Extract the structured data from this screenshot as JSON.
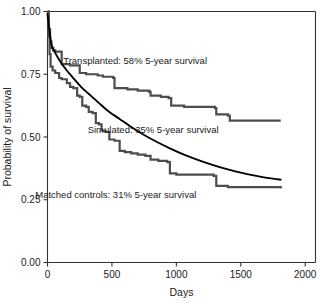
{
  "chart_data": {
    "type": "line",
    "title": "",
    "xlabel": "Days",
    "ylabel": "Probability of survival",
    "xlim": [
      0,
      2080
    ],
    "ylim": [
      0,
      1
    ],
    "xticks": [
      0,
      500,
      1000,
      1500,
      2000
    ],
    "xtick_labels": [
      "0",
      "500",
      "1000",
      "1500",
      "2000"
    ],
    "yticks": [
      0,
      0.25,
      0.5,
      0.75,
      1
    ],
    "ytick_labels": [
      "0.00",
      "0.25",
      "0.50",
      "0.75",
      "1.00"
    ],
    "grid": false,
    "legend_position": "inline-annotations",
    "series": [
      {
        "name": "Transplanted",
        "style": "step",
        "color": "#4d4d4d",
        "five_year_survival_pct": 58,
        "x": [
          0,
          10,
          20,
          30,
          45,
          60,
          110,
          175,
          250,
          250,
          300,
          390,
          430,
          510,
          520,
          620,
          700,
          790,
          800,
          880,
          940,
          960,
          1060,
          1300,
          1310,
          1400,
          1415,
          1810
        ],
        "y": [
          1.0,
          0.93,
          0.88,
          0.855,
          0.845,
          0.84,
          0.79,
          0.785,
          0.78,
          0.755,
          0.75,
          0.745,
          0.74,
          0.735,
          0.695,
          0.69,
          0.685,
          0.68,
          0.665,
          0.66,
          0.655,
          0.625,
          0.62,
          0.615,
          0.59,
          0.585,
          0.565,
          0.565
        ]
      },
      {
        "name": "Matched controls",
        "style": "step",
        "color": "#4d4d4d",
        "five_year_survival_pct": 31,
        "x": [
          0,
          8,
          16,
          24,
          40,
          60,
          90,
          110,
          150,
          175,
          200,
          230,
          250,
          270,
          300,
          320,
          350,
          375,
          400,
          420,
          450,
          480,
          520,
          560,
          600,
          650,
          700,
          760,
          800,
          860,
          930,
          950,
          1000,
          1290,
          1310,
          1400,
          1810
        ],
        "y": [
          1.0,
          0.9,
          0.83,
          0.78,
          0.765,
          0.755,
          0.735,
          0.73,
          0.715,
          0.7,
          0.695,
          0.665,
          0.66,
          0.625,
          0.62,
          0.6,
          0.595,
          0.555,
          0.55,
          0.525,
          0.52,
          0.49,
          0.485,
          0.445,
          0.44,
          0.435,
          0.43,
          0.425,
          0.41,
          0.405,
          0.4,
          0.355,
          0.35,
          0.345,
          0.305,
          0.3,
          0.295
        ]
      },
      {
        "name": "Simulated",
        "style": "smooth",
        "color": "#000000",
        "five_year_survival_pct": 35,
        "x": [
          0,
          30,
          60,
          100,
          150,
          200,
          260,
          320,
          400,
          480,
          560,
          650,
          750,
          850,
          950,
          1050,
          1150,
          1250,
          1350,
          1450,
          1550,
          1650,
          1750,
          1810
        ],
        "y": [
          0.99,
          0.87,
          0.835,
          0.8,
          0.765,
          0.735,
          0.7,
          0.672,
          0.635,
          0.6,
          0.572,
          0.54,
          0.508,
          0.48,
          0.455,
          0.432,
          0.412,
          0.394,
          0.378,
          0.364,
          0.352,
          0.342,
          0.334,
          0.33
        ]
      }
    ],
    "annotations": [
      {
        "name": "transplanted",
        "text": "Transplanted: 58% 5-year survival",
        "x": 680,
        "y": 0.79
      },
      {
        "name": "simulated",
        "text": "Simulated: 35% 5-year survival",
        "x": 820,
        "y": 0.515
      },
      {
        "name": "matched-controls",
        "text": "Matched controls: 31% 5-year survival",
        "x": 530,
        "y": 0.255
      }
    ]
  }
}
